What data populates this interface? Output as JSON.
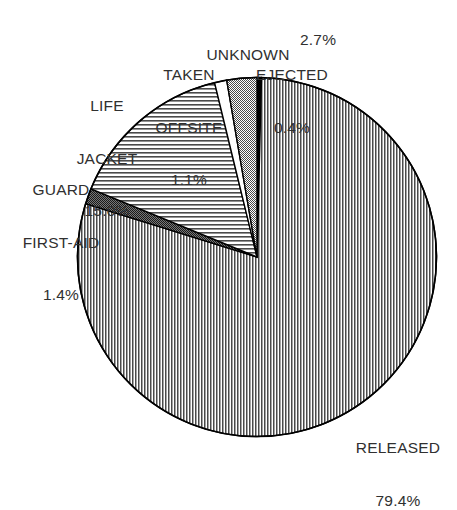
{
  "chart_data": {
    "type": "pie",
    "title": "",
    "subtitle": "",
    "xlabel": "",
    "ylabel": "",
    "legend_position": "none",
    "grid": false,
    "units": "percent",
    "start_angle_deg": 0,
    "direction": "clockwise",
    "categories": [
      "EJECTED",
      "RELEASED",
      "GUARD FIRST-AID",
      "LIFE JACKET",
      "TAKEN OFFSITE",
      "UNKNOWN"
    ],
    "values": [
      0.4,
      79.4,
      1.4,
      15.0,
      1.1,
      2.7
    ],
    "slices": [
      {
        "id": "ejected",
        "label": "EJECTED",
        "value": 0.4,
        "value_text": "0.4%",
        "fill": "solid-black",
        "color": "#000000",
        "start_deg": 0.0,
        "end_deg": 1.44
      },
      {
        "id": "released",
        "label": "RELEASED",
        "value": 79.4,
        "value_text": "79.4%",
        "fill": "vertical-lines",
        "color": "#555555",
        "start_deg": 1.44,
        "end_deg": 287.28
      },
      {
        "id": "guard-first-aid",
        "label": "GUARD FIRST-AID",
        "value": 1.4,
        "value_text": "1.4%",
        "fill": "dense-checker",
        "color": "#3a3a3a",
        "start_deg": 287.28,
        "end_deg": 292.32
      },
      {
        "id": "life-jacket",
        "label": "LIFE JACKET",
        "value": 15.0,
        "value_text": "15.0%",
        "fill": "horizontal-lines",
        "color": "#555555",
        "start_deg": 292.32,
        "end_deg": 346.32
      },
      {
        "id": "taken-offsite",
        "label": "TAKEN OFFSITE",
        "value": 1.1,
        "value_text": "1.1%",
        "fill": "white",
        "color": "#ffffff",
        "start_deg": 346.32,
        "end_deg": 350.28
      },
      {
        "id": "unknown",
        "label": "UNKNOWN",
        "value": 2.7,
        "value_text": "2.7%",
        "fill": "stipple-gray",
        "color": "#6e6e6e",
        "start_deg": 350.28,
        "end_deg": 360.0
      }
    ]
  },
  "labels": {
    "unknown": {
      "name": "UNKNOWN",
      "pct": "2.7%"
    },
    "taken": {
      "line1": "TAKEN",
      "line2": "OFFSITE",
      "pct": "1.1%"
    },
    "ejected": {
      "name": "EJECTED",
      "pct": "0.4%"
    },
    "lifejacket": {
      "line1": "LIFE",
      "line2": "JACKET",
      "pct": "15.0%"
    },
    "guard": {
      "line1": "GUARD",
      "line2": "FIRST-AID",
      "pct": "1.4%"
    },
    "released": {
      "name": "RELEASED",
      "pct": "79.4%"
    }
  },
  "style": {
    "background": "#ffffff",
    "text_color": "#303030",
    "outline_color": "#000000"
  }
}
